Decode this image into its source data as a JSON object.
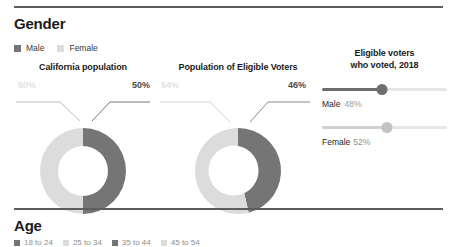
{
  "sections": {
    "gender": {
      "title": "Gender"
    },
    "age": {
      "title": "Age"
    }
  },
  "legend": {
    "items": [
      {
        "label": "Male",
        "color": "#757575"
      },
      {
        "label": "Female",
        "color": "#dcdcdc"
      }
    ]
  },
  "charts": {
    "california": {
      "title": "California population",
      "left_label": "50%",
      "right_label": "50%"
    },
    "eligible": {
      "title": "Population of Eligible Voters",
      "left_label": "54%",
      "right_label": "46%"
    }
  },
  "voted": {
    "title_line1": "Eligible voters",
    "title_line2": "who voted, 2018",
    "sliders": [
      {
        "name": "Male",
        "value": "48%",
        "percent": 48
      },
      {
        "name": "Female",
        "value": "52%",
        "percent": 52
      }
    ]
  },
  "age_legend": {
    "items": [
      {
        "label": "18 to 24"
      },
      {
        "label": "25 to 34"
      },
      {
        "label": "35 to 44"
      },
      {
        "label": "45 to 54"
      },
      {
        "label": "55 to 64"
      },
      {
        "label": "65 and older"
      }
    ]
  },
  "chart_data": [
    {
      "type": "pie",
      "title": "California population",
      "categories": [
        "Male",
        "Female"
      ],
      "values": [
        50,
        50
      ],
      "colors": [
        "#757575",
        "#dcdcdc"
      ],
      "units": "percent",
      "donut": true,
      "start_angle": 0,
      "direction": "clockwise",
      "legend_position": "top-left",
      "data_labels": [
        "50%",
        "50%"
      ]
    },
    {
      "type": "pie",
      "title": "Population of Eligible Voters",
      "categories": [
        "Male",
        "Female"
      ],
      "values": [
        46,
        54
      ],
      "colors": [
        "#757575",
        "#dcdcdc"
      ],
      "units": "percent",
      "donut": true,
      "start_angle": 0,
      "direction": "clockwise",
      "legend_position": "top-left",
      "data_labels": [
        "46%",
        "54%"
      ]
    },
    {
      "type": "bar",
      "title": "Eligible voters who voted, 2018",
      "orientation": "horizontal",
      "categories": [
        "Male",
        "Female"
      ],
      "values": [
        48,
        52
      ],
      "colors": [
        "#6e6e6e",
        "#c2c2c2"
      ],
      "units": "percent",
      "xlim": [
        0,
        100
      ],
      "grid": false,
      "data_labels": [
        "48%",
        "52%"
      ]
    }
  ]
}
